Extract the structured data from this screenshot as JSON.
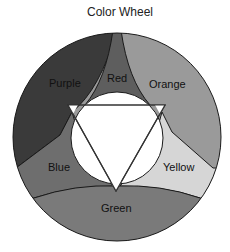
{
  "diagram": {
    "title": "Color Wheel",
    "segments": [
      {
        "id": "purple",
        "label": "Purple",
        "color": "#3a3a3a"
      },
      {
        "id": "red",
        "label": "Red",
        "color": "#5e5e5e"
      },
      {
        "id": "orange",
        "label": "Orange",
        "color": "#9a9a9a"
      },
      {
        "id": "yellow",
        "label": "Yellow",
        "color": "#d6d6d6"
      },
      {
        "id": "green",
        "label": "Green",
        "color": "#7a7a7a"
      },
      {
        "id": "blue",
        "label": "Blue",
        "color": "#6e6e6e"
      }
    ],
    "center": {
      "shape": "circle",
      "color": "#ffffff"
    },
    "overlay": {
      "shape": "inverted-triangle",
      "stroke": "#333333"
    }
  }
}
